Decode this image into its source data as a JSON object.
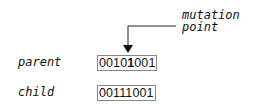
{
  "annotation": {
    "line1": "mutation",
    "line2": "point"
  },
  "rows": [
    {
      "label": "parent",
      "bits_before": "0010",
      "bit_mut": "1",
      "bits_after": "001"
    },
    {
      "label": "child",
      "bits": "00111001"
    }
  ]
}
